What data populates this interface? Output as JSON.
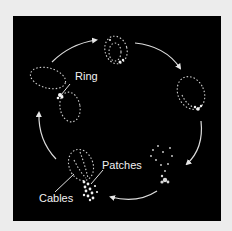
{
  "figure": {
    "background_color": "#ececec",
    "panel_color": "#000000",
    "labels": {
      "ring": "Ring",
      "patches": "Patches",
      "cables": "Cables"
    },
    "stages": [
      {
        "position": "top"
      },
      {
        "position": "right"
      },
      {
        "position": "bottom-right"
      },
      {
        "position": "bottom-left"
      },
      {
        "position": "left"
      }
    ],
    "arrow_direction": "clockwise",
    "arrow_count": 5
  }
}
